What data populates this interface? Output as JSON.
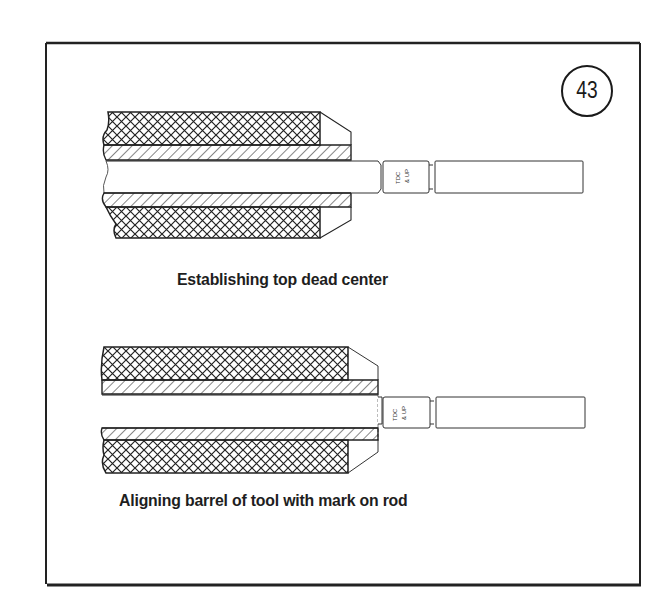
{
  "figure": {
    "number": "43",
    "panels": [
      {
        "caption": "Establishing top dead center",
        "gauge_marking": "TDC & UP"
      },
      {
        "caption": "Aligning barrel of tool with mark on rod",
        "gauge_marking": "TDC & UP"
      }
    ]
  },
  "colors": {
    "ink": "#1e1e1e",
    "paper": "#ffffff"
  }
}
